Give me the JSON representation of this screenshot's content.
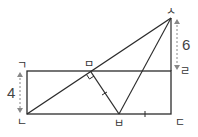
{
  "diagram": {
    "type": "geometry",
    "colors": {
      "line": "#2b2b2b",
      "dim": "#888888",
      "text": "#333333"
    },
    "points": {
      "g": {
        "label": "ㄱ",
        "x": 27,
        "y": 71
      },
      "n": {
        "label": "ㄴ",
        "x": 27,
        "y": 114
      },
      "d": {
        "label": "ㄷ",
        "x": 171,
        "y": 114
      },
      "r": {
        "label": "ㄹ",
        "x": 171,
        "y": 71
      },
      "m": {
        "label": "ㅁ",
        "x": 91,
        "y": 71
      },
      "b": {
        "label": "ㅂ",
        "x": 119,
        "y": 114
      },
      "s": {
        "label": "ㅅ",
        "x": 171,
        "y": 18
      }
    },
    "dimensions": [
      {
        "label": "4",
        "from": "ㄱ",
        "to": "ㄴ",
        "side": "left"
      },
      {
        "label": "6",
        "from": "ㅅ",
        "to": "ㄹ",
        "side": "right"
      }
    ],
    "marks": {
      "right_angle_at": "ㅁ",
      "equal_ticks": [
        "ㅁㅂ",
        "ㅂㄷ"
      ]
    },
    "labels": {
      "g": "ㄱ",
      "n": "ㄴ",
      "d": "ㄷ",
      "r": "ㄹ",
      "m": "ㅁ",
      "b": "ㅂ",
      "s": "ㅅ",
      "dim_left": "4",
      "dim_right": "6"
    }
  }
}
